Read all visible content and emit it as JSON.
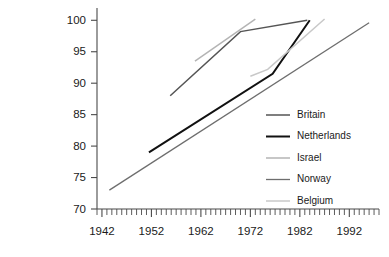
{
  "chart_data": {
    "type": "line",
    "title": "",
    "xlabel": "",
    "ylabel": "",
    "xlim": [
      1941,
      1998
    ],
    "ylim": [
      70,
      101
    ],
    "yticks": [
      70,
      75,
      80,
      85,
      90,
      95,
      100
    ],
    "xticks": [
      1942,
      1952,
      1962,
      1972,
      1982,
      1992
    ],
    "xtick_minor_step": 1,
    "grid": false,
    "legend_position": "right-middle",
    "series": [
      {
        "name": "Britain",
        "color": "#555555",
        "width": 1.5,
        "points": [
          [
            1955.8,
            88.0
          ],
          [
            1970.0,
            98.2
          ],
          [
            1983.5,
            100.0
          ]
        ]
      },
      {
        "name": "Netherlands",
        "color": "#111111",
        "width": 2.0,
        "points": [
          [
            1951.5,
            79.0
          ],
          [
            1976.5,
            91.5
          ],
          [
            1984.0,
            100.0
          ]
        ]
      },
      {
        "name": "Israel",
        "color": "#b4b4b4",
        "width": 1.5,
        "points": [
          [
            1960.8,
            93.5
          ],
          [
            1973.0,
            100.2
          ]
        ]
      },
      {
        "name": "Norway",
        "color": "#6e6e6e",
        "width": 1.3,
        "points": [
          [
            1943.5,
            73.0
          ],
          [
            1996.0,
            99.6
          ]
        ]
      },
      {
        "name": "Belgium",
        "color": "#c8c8c8",
        "width": 1.5,
        "points": [
          [
            1972.0,
            91.1
          ],
          [
            1975.5,
            92.2
          ],
          [
            1987.0,
            100.2
          ]
        ]
      }
    ]
  },
  "legend": {
    "items": [
      {
        "label": "Britain"
      },
      {
        "label": "Netherlands"
      },
      {
        "label": "Israel"
      },
      {
        "label": "Norway"
      },
      {
        "label": "Belgium"
      }
    ]
  },
  "axis": {
    "y_labels": [
      "100",
      "95",
      "90",
      "85",
      "80",
      "75",
      "70"
    ],
    "x_labels": [
      "1942",
      "1952",
      "1962",
      "1972",
      "1982",
      "1992"
    ]
  }
}
